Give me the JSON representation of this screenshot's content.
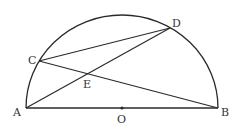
{
  "diagram": {
    "type": "semicircle-geometry",
    "stroke_color": "#2a2a2a",
    "points": {
      "A": {
        "label": "A",
        "x": 26,
        "y": 108
      },
      "B": {
        "label": "B",
        "x": 218,
        "y": 108
      },
      "O": {
        "label": "O",
        "x": 122,
        "y": 108
      },
      "C": {
        "label": "C",
        "x": 39,
        "y": 61
      },
      "D": {
        "label": "D",
        "x": 170,
        "y": 28
      },
      "E": {
        "label": "E",
        "x": 87,
        "y": 74
      }
    },
    "segments": [
      "AB",
      "AD",
      "CB",
      "CD"
    ],
    "arc": "semicircle on diameter AB, center O"
  }
}
